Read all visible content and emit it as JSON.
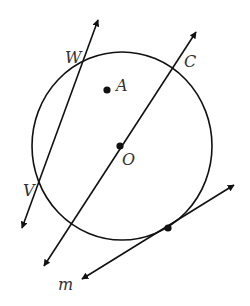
{
  "diagram": {
    "type": "circle-geometry",
    "colors": {
      "stroke": "#111111",
      "label": "#333333",
      "background": "#ffffff"
    },
    "circle": {
      "center_label": "O",
      "cx": 122,
      "cy": 146,
      "rx": 90,
      "ry": 94
    },
    "points": [
      {
        "name": "A",
        "label": "A",
        "x": 107,
        "y": 90,
        "label_x": 116,
        "label_y": 91,
        "marked": true
      },
      {
        "name": "O",
        "label": "O",
        "x": 120,
        "y": 146,
        "label_x": 122,
        "label_y": 165,
        "marked": true
      },
      {
        "name": "W",
        "label": "W",
        "x": 82,
        "y": 58,
        "label_x": 65,
        "label_y": 63,
        "marked": false
      },
      {
        "name": "C",
        "label": "C",
        "x": 173,
        "y": 68,
        "label_x": 184,
        "label_y": 67,
        "marked": false
      },
      {
        "name": "V",
        "label": "V",
        "x": 37,
        "y": 183,
        "label_x": 23,
        "label_y": 196,
        "marked": false
      },
      {
        "name": "tangent-point",
        "label": "",
        "x": 168,
        "y": 228,
        "marked": true
      }
    ],
    "lines": [
      {
        "name": "secant-WV",
        "x1": 98,
        "y1": 20,
        "x2": 22,
        "y2": 228,
        "arrows": "both"
      },
      {
        "name": "line-through-O-C",
        "x1": 196,
        "y1": 32,
        "x2": 44,
        "y2": 266,
        "arrows": "both"
      },
      {
        "name": "tangent-m",
        "x1": 234,
        "y1": 185,
        "x2": 82,
        "y2": 279,
        "arrows": "both",
        "label": "m",
        "label_x": 58,
        "label_y": 290
      }
    ],
    "labels": {
      "W": "W",
      "A": "A",
      "C": "C",
      "O": "O",
      "V": "V",
      "m": "m"
    }
  }
}
